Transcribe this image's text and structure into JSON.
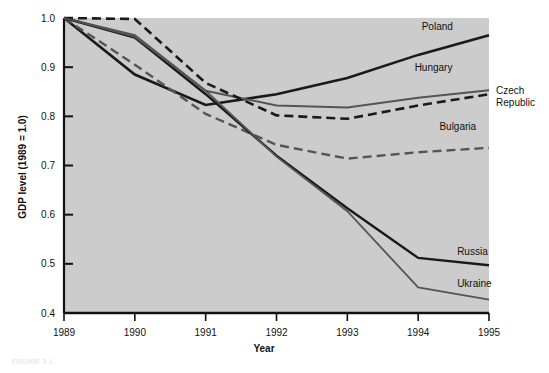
{
  "figure": {
    "caption": "FIGURE 3.1"
  },
  "chart_data": {
    "type": "line",
    "title": "",
    "xlabel": "Year",
    "ylabel": "GDP level (1989 = 1.0)",
    "x": [
      1989,
      1990,
      1991,
      1992,
      1993,
      1994,
      1995
    ],
    "xtick_labels": [
      "1989",
      "1990",
      "1991",
      "1992",
      "1993",
      "1994",
      "1995"
    ],
    "ytick_labels": [
      "0.4",
      "0.5",
      "0.6",
      "0.7",
      "0.8",
      "0.9",
      "1.0"
    ],
    "yticks": [
      0.4,
      0.5,
      0.6,
      0.7,
      0.8,
      0.9,
      1.0
    ],
    "xlim": [
      1989,
      1995
    ],
    "ylim": [
      0.4,
      1.0
    ],
    "grid": false,
    "legend_position": "line-end-labels",
    "plot_background": "#cccccc",
    "series": [
      {
        "name": "Poland",
        "values": [
          1.0,
          0.885,
          0.823,
          0.845,
          0.878,
          0.925,
          0.965
        ],
        "color": "#1a1a1a",
        "style": "solid",
        "width": 2.6,
        "label_x": 1994.05,
        "label_y": 0.975,
        "anchor": "start"
      },
      {
        "name": "Hungary",
        "values": [
          1.0,
          0.965,
          0.852,
          0.822,
          0.818,
          0.838,
          0.853
        ],
        "color": "#555555",
        "style": "solid",
        "width": 2.0,
        "label_x": 1993.95,
        "label_y": 0.893,
        "anchor": "start"
      },
      {
        "name": "Czech Republic",
        "values": [
          1.0,
          0.998,
          0.868,
          0.802,
          0.795,
          0.822,
          0.845
        ],
        "color": "#1a1a1a",
        "style": "dashed",
        "width": 2.6,
        "label_x": 1995.1,
        "label_y": 0.845,
        "anchor": "start",
        "label_lines": [
          "Czech",
          "Republic"
        ]
      },
      {
        "name": "Bulgaria",
        "values": [
          1.0,
          0.905,
          0.805,
          0.742,
          0.714,
          0.727,
          0.736
        ],
        "color": "#555555",
        "style": "dashed",
        "width": 2.4,
        "label_x": 1994.3,
        "label_y": 0.772,
        "anchor": "start"
      },
      {
        "name": "Russia",
        "values": [
          1.0,
          0.96,
          0.845,
          0.72,
          0.613,
          0.512,
          0.497
        ],
        "color": "#1a1a1a",
        "style": "solid",
        "width": 2.4,
        "label_x": 1994.55,
        "label_y": 0.518,
        "anchor": "start"
      },
      {
        "name": "Ukraine",
        "values": [
          1.0,
          0.962,
          0.852,
          0.718,
          0.607,
          0.452,
          0.427
        ],
        "color": "#555555",
        "style": "solid",
        "width": 1.8,
        "label_x": 1994.55,
        "label_y": 0.452,
        "anchor": "start"
      }
    ]
  }
}
